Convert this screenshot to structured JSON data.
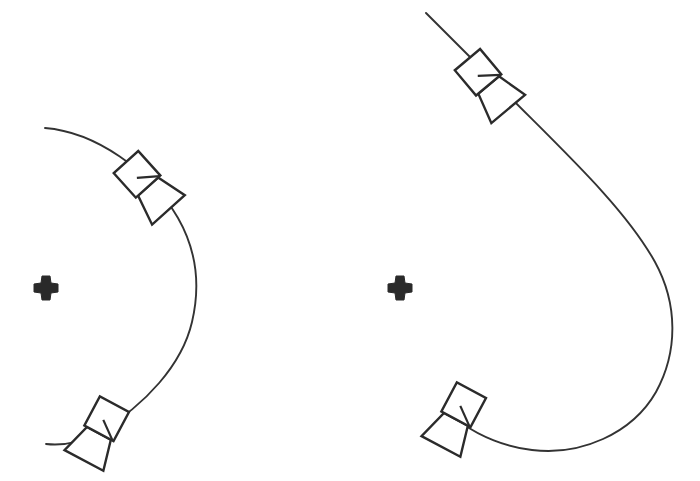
{
  "figure": {
    "title": "Spacecraft trajectory diagram",
    "background_color": "#ffffff",
    "stroke_color": "#333333",
    "marker_color": "#2a2a2a",
    "width": 700,
    "height": 481
  },
  "panels": [
    {
      "id": "panel-left",
      "name": "left-trajectory-panel",
      "label": "Left trajectory",
      "central_body": {
        "name": "central-body-marker",
        "label": "Central body",
        "symbol": "four-pointed-cross",
        "x": 46,
        "y": 288,
        "size": 24
      },
      "trajectory": {
        "name": "left-trajectory-path",
        "label": "Hyperbolic flyby trajectory",
        "shape": "open arc bulging to the right",
        "path": "M 45 128 C 95 132 150 170 178 218 C 198 253 200 288 192 322 C 182 365 145 405 100 432 C 82 442 64 446 46 444",
        "start_point": [
          45,
          128
        ],
        "end_point": [
          46,
          444
        ],
        "max_x": 200,
        "max_x_at_y": 288
      },
      "spacecraft": [
        {
          "name": "spacecraft-upper-left",
          "label": "Spacecraft position 1",
          "x": 137,
          "y": 175,
          "rotation_deg": -42,
          "scale": 1.0
        },
        {
          "name": "spacecraft-lower-left",
          "label": "Spacecraft position 2",
          "x": 106,
          "y": 419,
          "rotation_deg": 28,
          "scale": 1.0
        }
      ]
    },
    {
      "id": "panel-right",
      "name": "right-trajectory-panel",
      "label": "Right trajectory",
      "central_body": {
        "name": "central-body-marker",
        "label": "Central body",
        "symbol": "four-pointed-cross",
        "x": 400,
        "y": 288,
        "size": 24
      },
      "trajectory": {
        "name": "right-trajectory-path",
        "label": "Capture / loop trajectory",
        "shape": "long inbound leg curving into a closed loop to the right and below",
        "path": "M 426 13 L 497 84 C 560 148 624 206 655 262 C 678 304 678 352 656 392 C 632 434 580 456 532 450 C 505 447 480 436 463 424",
        "start_point": [
          426,
          13
        ],
        "end_point": [
          463,
          424
        ],
        "max_x": 676,
        "max_x_at_y": 330,
        "min_y_of_loop_bottom": 456
      },
      "spacecraft": [
        {
          "name": "spacecraft-upper-right",
          "label": "Spacecraft position 1",
          "x": 478,
          "y": 73,
          "rotation_deg": -40,
          "scale": 1.0
        },
        {
          "name": "spacecraft-lower-right",
          "label": "Spacecraft position 2",
          "x": 463,
          "y": 405,
          "rotation_deg": 28,
          "scale": 1.0
        }
      ]
    }
  ],
  "spacecraft_icon": {
    "name": "spacecraft-icon",
    "label": "Spacecraft",
    "parts": {
      "bus": {
        "name": "spacecraft-bus",
        "label": "Spacecraft bus",
        "shape": "square",
        "points": "-16,-17 17,-17 17,16 -16,16"
      },
      "antenna": {
        "name": "spacecraft-antenna",
        "label": "Conical antenna dish",
        "shape": "trapezoid",
        "points": "-13,16 14,16 22,47 -22,47"
      },
      "boom": {
        "name": "spacecraft-boom",
        "label": "Instrument boom",
        "shape": "line",
        "points": "-2,2 16,16"
      }
    }
  },
  "marker_icon": {
    "name": "four-pointed-cross-icon",
    "label": "Body marker",
    "shape": "four-pointed cross",
    "points": "-4,-12 4,-12 5,-5 12,-4 12,4 5,5 4,12 -4,12 -5,5 -12,4 -12,-4 -5,-5"
  }
}
